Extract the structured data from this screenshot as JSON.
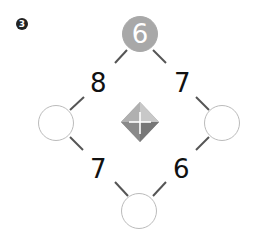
{
  "problem": {
    "badge": "3",
    "top_value": "6",
    "edges": {
      "top_left": "8",
      "top_right": "7",
      "bottom_left": "7",
      "bottom_right": "6"
    },
    "circles": {
      "left": "",
      "right": "",
      "bottom": ""
    },
    "center_icon": "plus-gem-icon",
    "colors": {
      "filled_circle": "#a8a8a8",
      "empty_circle_border": "#bbbbbb",
      "lines": "#555555"
    }
  }
}
